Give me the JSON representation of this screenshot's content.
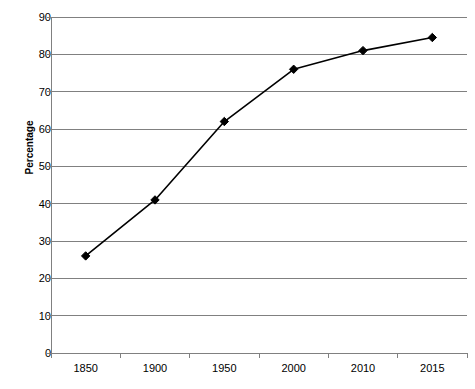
{
  "chart_data": {
    "type": "line",
    "title": "",
    "xlabel": "",
    "ylabel": "Percentage",
    "categories": [
      "1850",
      "1900",
      "1950",
      "2000",
      "2010",
      "2015"
    ],
    "values": [
      26,
      41,
      62,
      76,
      81,
      84.5
    ],
    "series": [
      {
        "name": "Percentage",
        "values": [
          26,
          41,
          62,
          76,
          81,
          84.5
        ]
      }
    ],
    "ylim": [
      0,
      90
    ],
    "yticks": [
      0,
      10,
      20,
      30,
      40,
      50,
      60,
      70,
      80,
      90
    ],
    "ytick_labels": [
      "0",
      "10",
      "20",
      "30",
      "40",
      "50",
      "60",
      "70",
      "80",
      "90"
    ],
    "grid": "horizontal",
    "legend": "none",
    "marker": "diamond",
    "line_color": "#000000",
    "marker_color": "#000000",
    "grid_color": "#808080",
    "axis_color": "#808080",
    "background": "#ffffff"
  },
  "axis": {
    "y_title": "Percentage"
  }
}
